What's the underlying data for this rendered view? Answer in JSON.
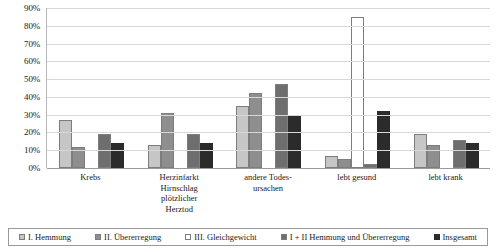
{
  "chart_data": {
    "type": "bar",
    "title": "",
    "xlabel": "",
    "ylabel": "",
    "ylim": [
      0,
      90
    ],
    "ytick_labels": [
      "90%",
      "80%",
      "70%",
      "60%",
      "50%",
      "40%",
      "30%",
      "20%",
      "10%",
      "0%"
    ],
    "yticks": [
      90,
      80,
      70,
      60,
      50,
      40,
      30,
      20,
      10,
      0
    ],
    "grid": true,
    "legend_position": "bottom",
    "categories": [
      "Krebs",
      "Herzinfarkt\nHirnschlag\nplötzlicher\nHerztod",
      "andere Todes-\nursachen",
      "lebt gesund",
      "lebt krank"
    ],
    "series": [
      {
        "name": "I. Hemmung",
        "color": "#c6c6c6",
        "values": [
          27,
          13,
          35,
          7,
          19
        ]
      },
      {
        "name": "II. Übererregung",
        "color": "#8e8e8e",
        "values": [
          12,
          31,
          42,
          5,
          13
        ]
      },
      {
        "name": "III. Gleichgewicht",
        "color": "#ffffff",
        "values": [
          0,
          0,
          0,
          85,
          0
        ]
      },
      {
        "name": "I + II Hemmung und Übererregung",
        "color": "#6e6e6e",
        "values": [
          19,
          19,
          47,
          2,
          16
        ]
      },
      {
        "name": "Insgesamt",
        "color": "#2b2b2b",
        "values": [
          14,
          14,
          30,
          32,
          14
        ]
      }
    ]
  },
  "legend": {
    "items": [
      {
        "label": "I. Hemmung"
      },
      {
        "label": "II. Übererregung"
      },
      {
        "label": "III. Gleichgewicht"
      },
      {
        "label": "I + II Hemmung und Übererregung"
      },
      {
        "label": "Insgesamt"
      }
    ]
  }
}
